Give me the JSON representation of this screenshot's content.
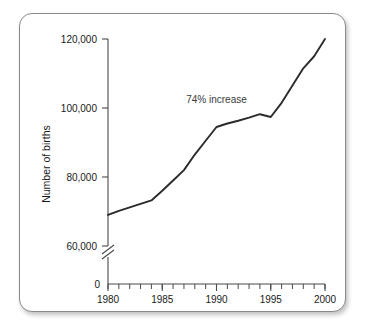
{
  "figure": {
    "background_color": "#ffffff",
    "border_color": "#8a8a8a"
  },
  "chart_data": {
    "type": "line",
    "title": "",
    "xlabel": "",
    "ylabel": "Number of births",
    "xlim": [
      1980,
      2000
    ],
    "ylim": [
      60000,
      120000
    ],
    "y_axis_break": true,
    "y_axis_break_note": "axis broken between 0 and 60,000",
    "grid": false,
    "legend": false,
    "line_color": "#2b2b2b",
    "x_tick_labels": [
      "1980",
      "1985",
      "1990",
      "1995",
      "2000"
    ],
    "x_ticks": [
      1980,
      1985,
      1990,
      1995,
      2000
    ],
    "x_minor_tick_interval": 1,
    "y_tick_labels": [
      "0",
      "60,000",
      "80,000",
      "100,000",
      "120,000"
    ],
    "y_ticks": [
      0,
      60000,
      80000,
      100000,
      120000
    ],
    "x": [
      1980,
      1981,
      1982,
      1983,
      1984,
      1985,
      1986,
      1987,
      1988,
      1989,
      1990,
      1991,
      1992,
      1993,
      1994,
      1995,
      1996,
      1997,
      1998,
      1999,
      2000
    ],
    "values": [
      69000,
      70200,
      71200,
      72200,
      73200,
      76000,
      79000,
      82000,
      86500,
      90500,
      94500,
      95500,
      96300,
      97200,
      98200,
      97400,
      101500,
      106500,
      111500,
      115000,
      120000
    ],
    "series": [
      {
        "name": "Number of births",
        "values": [
          69000,
          70200,
          71200,
          72200,
          73200,
          76000,
          79000,
          82000,
          86500,
          90500,
          94500,
          95500,
          96300,
          97200,
          98200,
          97400,
          101500,
          106500,
          111500,
          115000,
          120000
        ]
      }
    ],
    "annotations": [
      {
        "text": "74% increase",
        "x": 1990,
        "y": 101500
      }
    ]
  },
  "axis": {
    "y_title": "Number of births",
    "y_labels": {
      "t120000": "120,000",
      "t100000": "100,000",
      "t80000": "80,000",
      "t60000": "60,000",
      "t0": "0"
    },
    "x_labels": {
      "t1980": "1980",
      "t1985": "1985",
      "t1990": "1990",
      "t1995": "1995",
      "t2000": "2000"
    }
  },
  "annotation": {
    "increase_label": "74% increase"
  }
}
